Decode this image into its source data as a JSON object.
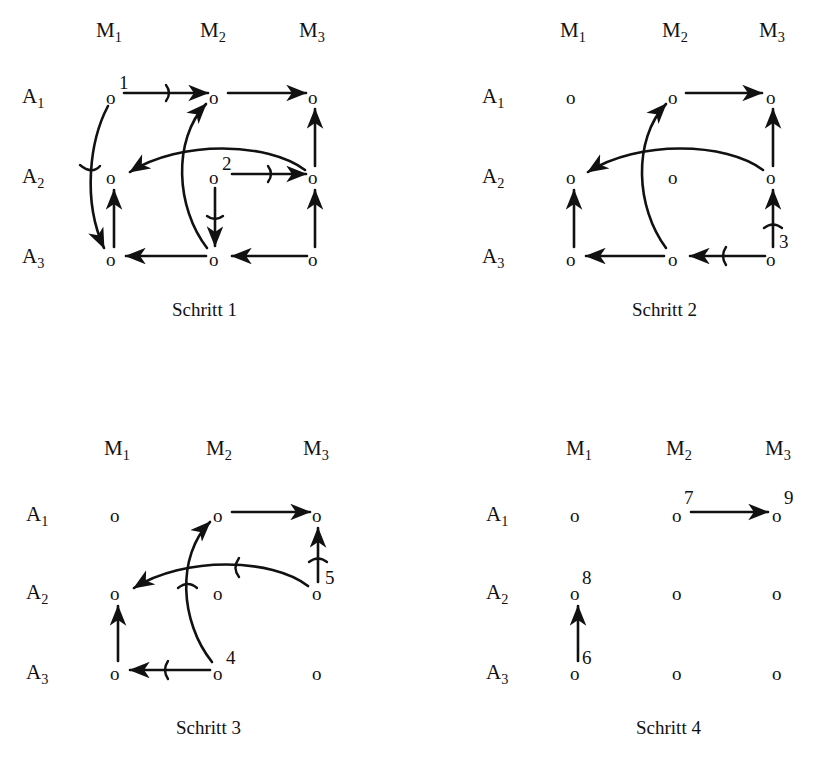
{
  "figure": {
    "background_color": "#ffffff",
    "ink_color": "#111111",
    "column_headers": [
      "M₁",
      "M₂",
      "M₃"
    ],
    "row_labels": [
      "A₁",
      "A₂",
      "A₃"
    ],
    "column_header_parts": [
      {
        "base": "M",
        "sub": "1"
      },
      {
        "base": "M",
        "sub": "2"
      },
      {
        "base": "M",
        "sub": "3"
      }
    ],
    "row_label_parts": [
      {
        "base": "A",
        "sub": "1"
      },
      {
        "base": "A",
        "sub": "2"
      },
      {
        "base": "A",
        "sub": "3"
      }
    ],
    "node_glyph": "o"
  },
  "panels": [
    {
      "id": "panel-1",
      "caption": "Schritt 1",
      "nodes": [
        {
          "row": "A1",
          "col": "M1",
          "label": "1"
        },
        {
          "row": "A1",
          "col": "M2",
          "label": ""
        },
        {
          "row": "A1",
          "col": "M3",
          "label": ""
        },
        {
          "row": "A2",
          "col": "M1",
          "label": ""
        },
        {
          "row": "A2",
          "col": "M2",
          "label": "2"
        },
        {
          "row": "A2",
          "col": "M3",
          "label": ""
        },
        {
          "row": "A3",
          "col": "M1",
          "label": ""
        },
        {
          "row": "A3",
          "col": "M2",
          "label": ""
        },
        {
          "row": "A3",
          "col": "M3",
          "label": ""
        }
      ],
      "edges": [
        {
          "from": "A1M1",
          "to": "A1M2",
          "kind": "straight-right",
          "tick": true
        },
        {
          "from": "A1M2",
          "to": "A1M3",
          "kind": "straight-right",
          "tick": false
        },
        {
          "from": "A2M2",
          "to": "A2M3",
          "kind": "straight-right",
          "tick": true
        },
        {
          "from": "A3M3",
          "to": "A3M2",
          "kind": "straight-left",
          "tick": false
        },
        {
          "from": "A3M2",
          "to": "A3M1",
          "kind": "straight-left",
          "tick": false
        },
        {
          "from": "A3M1",
          "to": "A2M1",
          "kind": "straight-up",
          "tick": false
        },
        {
          "from": "A3M3",
          "to": "A2M3",
          "kind": "straight-up",
          "tick": false
        },
        {
          "from": "A2M3",
          "to": "A1M3",
          "kind": "straight-up",
          "tick": false
        },
        {
          "from": "A2M2",
          "to": "A3M2",
          "kind": "straight-down",
          "tick": true
        },
        {
          "from": "A1M1",
          "to": "A3M1",
          "kind": "curve-down-left",
          "tick": true
        },
        {
          "from": "A2M3",
          "to": "A2M1",
          "kind": "curve-long-left",
          "tick": false
        },
        {
          "from": "A3M2",
          "to": "A1M2",
          "kind": "curve-up",
          "tick": false
        }
      ]
    },
    {
      "id": "panel-2",
      "caption": "Schritt 2",
      "nodes": [
        {
          "row": "A1",
          "col": "M1",
          "label": ""
        },
        {
          "row": "A1",
          "col": "M2",
          "label": ""
        },
        {
          "row": "A1",
          "col": "M3",
          "label": ""
        },
        {
          "row": "A2",
          "col": "M1",
          "label": ""
        },
        {
          "row": "A2",
          "col": "M2",
          "label": ""
        },
        {
          "row": "A2",
          "col": "M3",
          "label": ""
        },
        {
          "row": "A3",
          "col": "M1",
          "label": ""
        },
        {
          "row": "A3",
          "col": "M2",
          "label": ""
        },
        {
          "row": "A3",
          "col": "M3",
          "label": "3"
        }
      ],
      "edges": [
        {
          "from": "A1M2",
          "to": "A1M3",
          "kind": "straight-right",
          "tick": false
        },
        {
          "from": "A3M3",
          "to": "A3M2",
          "kind": "straight-left",
          "tick": true
        },
        {
          "from": "A3M2",
          "to": "A3M1",
          "kind": "straight-left",
          "tick": false
        },
        {
          "from": "A3M1",
          "to": "A2M1",
          "kind": "straight-up",
          "tick": false
        },
        {
          "from": "A3M3",
          "to": "A2M3",
          "kind": "straight-up",
          "tick": true
        },
        {
          "from": "A2M3",
          "to": "A1M3",
          "kind": "straight-up",
          "tick": false
        },
        {
          "from": "A2M3",
          "to": "A2M1",
          "kind": "curve-long-left",
          "tick": false
        },
        {
          "from": "A3M2",
          "to": "A1M2",
          "kind": "curve-up",
          "tick": false
        }
      ]
    },
    {
      "id": "panel-3",
      "caption": "Schritt 3",
      "nodes": [
        {
          "row": "A1",
          "col": "M1",
          "label": ""
        },
        {
          "row": "A1",
          "col": "M2",
          "label": ""
        },
        {
          "row": "A1",
          "col": "M3",
          "label": ""
        },
        {
          "row": "A2",
          "col": "M1",
          "label": ""
        },
        {
          "row": "A2",
          "col": "M2",
          "label": ""
        },
        {
          "row": "A2",
          "col": "M3",
          "label": "5"
        },
        {
          "row": "A3",
          "col": "M1",
          "label": ""
        },
        {
          "row": "A3",
          "col": "M2",
          "label": "4"
        },
        {
          "row": "A3",
          "col": "M3",
          "label": ""
        }
      ],
      "edges": [
        {
          "from": "A1M2",
          "to": "A1M3",
          "kind": "straight-right",
          "tick": false
        },
        {
          "from": "A3M2",
          "to": "A3M1",
          "kind": "straight-left",
          "tick": true
        },
        {
          "from": "A3M1",
          "to": "A2M1",
          "kind": "straight-up",
          "tick": false
        },
        {
          "from": "A2M3",
          "to": "A1M3",
          "kind": "straight-up",
          "tick": true
        },
        {
          "from": "A2M3",
          "to": "A2M1",
          "kind": "curve-long-left",
          "tick": true
        },
        {
          "from": "A3M2",
          "to": "A1M2",
          "kind": "curve-up",
          "tick": true
        }
      ]
    },
    {
      "id": "panel-4",
      "caption": "Schritt 4",
      "nodes": [
        {
          "row": "A1",
          "col": "M1",
          "label": ""
        },
        {
          "row": "A1",
          "col": "M2",
          "label": "7"
        },
        {
          "row": "A1",
          "col": "M3",
          "label": "9"
        },
        {
          "row": "A2",
          "col": "M1",
          "label": "8"
        },
        {
          "row": "A2",
          "col": "M2",
          "label": ""
        },
        {
          "row": "A2",
          "col": "M3",
          "label": ""
        },
        {
          "row": "A3",
          "col": "M1",
          "label": "6"
        },
        {
          "row": "A3",
          "col": "M2",
          "label": ""
        },
        {
          "row": "A3",
          "col": "M3",
          "label": ""
        }
      ],
      "edges": [
        {
          "from": "A1M2",
          "to": "A1M3",
          "kind": "straight-right",
          "tick": false
        },
        {
          "from": "A3M1",
          "to": "A2M1",
          "kind": "straight-up",
          "tick": false
        }
      ]
    }
  ]
}
